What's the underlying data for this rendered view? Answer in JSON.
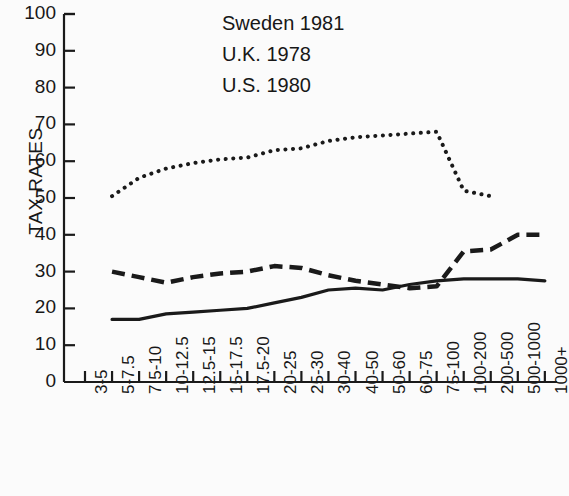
{
  "chart_data": {
    "type": "line",
    "title": "",
    "xlabel": "",
    "ylabel": "TAX RATES",
    "ylim": [
      0,
      100
    ],
    "ytick_values": [
      0,
      10,
      20,
      30,
      40,
      50,
      60,
      70,
      80,
      90,
      100
    ],
    "grid": false,
    "legend_position": "top-left",
    "categories": [
      "3-5",
      "5-7.5",
      "7.5-10",
      "10-12.5",
      "12.5-15",
      "15-17.5",
      "17.5-20",
      "20-25",
      "25-30",
      "30-40",
      "40-50",
      "50-60",
      "60-75",
      "75-100",
      "100-200",
      "200-500",
      "500-1000",
      "1000+"
    ],
    "series": [
      {
        "name": "Sweden 1981",
        "style": "dotted",
        "color": "#1a1a1a",
        "values": [
          null,
          50.5,
          55.5,
          58.0,
          59.5,
          60.5,
          61.0,
          63.0,
          63.5,
          65.5,
          66.5,
          67.0,
          67.5,
          68.0,
          52.0,
          50.5,
          null,
          null
        ]
      },
      {
        "name": "U.K. 1978",
        "style": "dashed",
        "color": "#1a1a1a",
        "values": [
          null,
          30.0,
          28.5,
          27.0,
          28.5,
          29.5,
          30.0,
          31.5,
          31.0,
          29.0,
          27.5,
          26.5,
          25.5,
          26.0,
          35.5,
          36.0,
          40.0,
          40.0
        ]
      },
      {
        "name": "U.S. 1980",
        "style": "solid",
        "color": "#1a1a1a",
        "values": [
          null,
          17.0,
          17.0,
          18.5,
          19.0,
          19.5,
          20.0,
          21.5,
          23.0,
          25.0,
          25.5,
          25.0,
          26.5,
          27.5,
          28.0,
          28.0,
          28.0,
          27.5
        ]
      }
    ]
  },
  "legend": {
    "items": [
      {
        "label": "Sweden 1981",
        "style": "dotted"
      },
      {
        "label": "U.K. 1978",
        "style": "dashed"
      },
      {
        "label": "U.S. 1980",
        "style": "solid"
      }
    ]
  },
  "axes": {
    "y_label": "TAX RATES",
    "y_ticks": [
      "100",
      "90",
      "80",
      "70",
      "60",
      "50",
      "40",
      "30",
      "20",
      "10",
      "0"
    ],
    "x_ticks": [
      "3-5",
      "5-7.5",
      "7.5-10",
      "10-12.5",
      "12.5-15",
      "15-17.5",
      "17.5-20",
      "20-25",
      "25-30",
      "30-40",
      "40-50",
      "50-60",
      "60-75",
      "75-100",
      "100-200",
      "200-500",
      "500-1000",
      "1000+"
    ]
  },
  "colors": {
    "ink": "#1a1a1a",
    "background": "#fbfbfb"
  }
}
